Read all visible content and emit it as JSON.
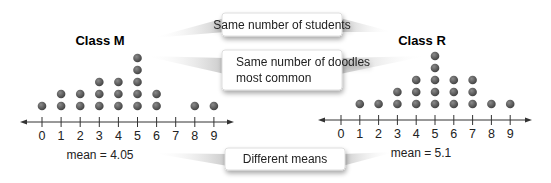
{
  "plots": [
    {
      "id": "class-m",
      "title": "Class M",
      "mean_label": "mean = 4.05",
      "x0": 42,
      "spacing": 19.1,
      "axis_y": 122,
      "arrow_left": 20,
      "arrow_right": 234,
      "title_x": 100,
      "title_y": 45,
      "mean_x": 100,
      "mean_y": 159
    },
    {
      "id": "class-r",
      "title": "Class R",
      "mean_label": "mean = 5.1",
      "x0": 341,
      "spacing": 18.8,
      "axis_y": 120,
      "arrow_left": 318,
      "arrow_right": 532,
      "title_x": 422,
      "title_y": 45,
      "mean_x": 421,
      "mean_y": 157
    }
  ],
  "callouts": [
    {
      "id": "same-students",
      "lines": [
        "Same number of students"
      ]
    },
    {
      "id": "same-mode",
      "lines": [
        "Same number of doodles",
        "most common"
      ]
    },
    {
      "id": "different-means",
      "lines": [
        "Different means"
      ]
    }
  ],
  "colors": {
    "dot": "#555555",
    "axis": "#333333",
    "callout_border": "#d0d0d0"
  },
  "chart_data": [
    {
      "type": "dot_plot",
      "title": "Class M",
      "categories": [
        0,
        1,
        2,
        3,
        4,
        5,
        6,
        7,
        8,
        9
      ],
      "values": [
        1,
        2,
        2,
        3,
        3,
        5,
        2,
        0,
        1,
        1
      ],
      "total": 20,
      "mean": 4.05,
      "xlabel": "",
      "ylabel": ""
    },
    {
      "type": "dot_plot",
      "title": "Class R",
      "categories": [
        0,
        1,
        2,
        3,
        4,
        5,
        6,
        7,
        8,
        9
      ],
      "values": [
        0,
        1,
        1,
        2,
        3,
        5,
        3,
        3,
        1,
        1
      ],
      "total": 20,
      "mean": 5.1,
      "xlabel": "",
      "ylabel": ""
    }
  ]
}
